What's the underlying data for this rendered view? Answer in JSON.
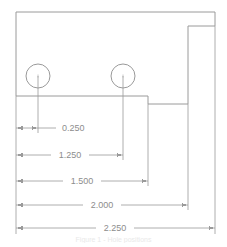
{
  "drawing": {
    "title": "Dimensioned part outline",
    "caption": "Figure 1 - Hole positions",
    "colors": {
      "outline": "#9a9a9a",
      "dimension_line": "#9a9a9a",
      "extension_line": "#9a9a9a",
      "text": "#888888",
      "background": "#ffffff",
      "caption_text": "#ececec"
    },
    "part": {
      "name": "bracket-outline",
      "holes": [
        {
          "name": "hole-left",
          "cx": 38,
          "cy": 76,
          "r": 12
        },
        {
          "name": "hole-right",
          "cx": 123,
          "cy": 76,
          "r": 12
        }
      ]
    },
    "dimensions": [
      {
        "id": "dim-0250",
        "value": "0.250",
        "y": 128,
        "x1": 16,
        "x2": 38,
        "label_x": 62,
        "label_anchor": "start"
      },
      {
        "id": "dim-1250",
        "value": "1.250",
        "y": 155,
        "x1": 16,
        "x2": 123,
        "label_x": 70,
        "label_anchor": "middle"
      },
      {
        "id": "dim-1500",
        "value": "1.500",
        "y": 181,
        "x1": 16,
        "x2": 148,
        "label_x": 82,
        "label_anchor": "middle"
      },
      {
        "id": "dim-2000",
        "value": "2.000",
        "y": 205,
        "x1": 16,
        "x2": 188,
        "label_x": 102,
        "label_anchor": "middle"
      },
      {
        "id": "dim-2250",
        "value": "2.250",
        "y": 228,
        "x1": 16,
        "x2": 215,
        "label_x": 115,
        "label_anchor": "middle"
      }
    ],
    "units": "inches"
  }
}
